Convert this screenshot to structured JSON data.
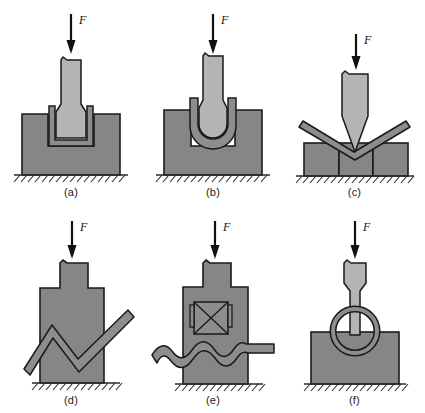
{
  "figure": {
    "background_color": "#ffffff",
    "punch_color": "#b4b4b4",
    "die_color": "#868686",
    "workpiece_color": "#8d8d8d",
    "outline_color": "#1a1a1a",
    "ground_color": "#2b2b2b",
    "force_symbol": "F",
    "panel_count": 6
  },
  "panels": [
    {
      "id": "a",
      "caption": "(a)",
      "force_label": "F",
      "operation": "deep-drawing-flat-bottom-punch",
      "elements": [
        "force-arrow",
        "punch",
        "blank",
        "die-cavity",
        "ground-hatching"
      ]
    },
    {
      "id": "b",
      "caption": "(b)",
      "force_label": "F",
      "operation": "deep-drawing-round-bottom-punch",
      "elements": [
        "force-arrow",
        "punch",
        "blank",
        "die-cavity",
        "ground-hatching"
      ]
    },
    {
      "id": "c",
      "caption": "(c)",
      "force_label": "F",
      "operation": "v-die-bending",
      "elements": [
        "force-arrow",
        "wedge-punch",
        "sheet",
        "die-blocks",
        "ground-hatching"
      ]
    },
    {
      "id": "d",
      "caption": "(d)",
      "force_label": "F",
      "operation": "zigzag-bending",
      "elements": [
        "force-arrow",
        "stepped-die",
        "zigzag-bar",
        "ground-hatching"
      ]
    },
    {
      "id": "e",
      "caption": "(e)",
      "force_label": "F",
      "operation": "corrugation-forming",
      "elements": [
        "force-arrow",
        "stepped-die",
        "crossed-box",
        "wavy-bar",
        "ground-hatching"
      ]
    },
    {
      "id": "f",
      "caption": "(f)",
      "force_label": "F",
      "operation": "ring-upsetting",
      "elements": [
        "force-arrow",
        "punch-stem",
        "ring",
        "anvil",
        "ground-hatching"
      ]
    }
  ]
}
